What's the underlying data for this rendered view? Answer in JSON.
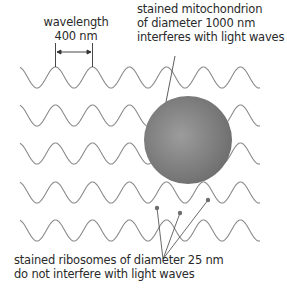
{
  "diagram": {
    "wavelength_label": {
      "line1": "wavelength",
      "line2": "400 nm"
    },
    "mitochondrion_label": {
      "line1": "stained mitochondrion",
      "line2": "of diameter 1000 nm",
      "line3": "interferes with light waves"
    },
    "ribosome_label": {
      "line1": "stained ribosomes of diameter 25 nm",
      "line2": "do not interfere with light waves"
    },
    "waves": {
      "count": 5,
      "color": "#8a8a8a",
      "wavelength_px": 37,
      "amplitude_px": 10.5,
      "start_x": 20,
      "end_x": 260,
      "peak_y": [
        67,
        105,
        143,
        182,
        220
      ]
    },
    "mitochondrion": {
      "cx": 188,
      "cy": 140,
      "r": 44,
      "color": "#7a7a7a",
      "highlight": "#9a9a9a"
    },
    "ribosomes": {
      "color": "#6e6e6e",
      "points": [
        [
          157,
          208
        ],
        [
          180,
          213
        ],
        [
          208,
          200
        ]
      ],
      "pointer_target": [
        163,
        259
      ]
    },
    "colors": {
      "text": "#2a2a2a",
      "line": "#333333"
    }
  }
}
